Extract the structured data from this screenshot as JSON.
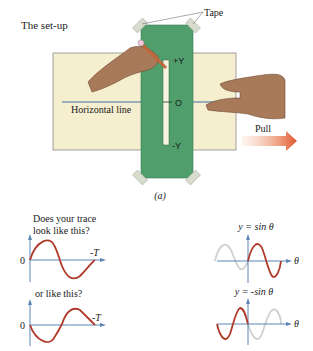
{
  "setup": {
    "title": "The set-up",
    "tape_label": "Tape",
    "strip_labels": {
      "top": "+Y",
      "middle": "O",
      "bottom": "-Y"
    },
    "horizontal_line_label": "Horizontal line",
    "pull_label": "Pull",
    "caption": "(a)"
  },
  "questions": {
    "q1": "Does your trace",
    "q1b": "look like this?",
    "q2": "or like this?"
  },
  "graphs": {
    "left1": {
      "zero": "0",
      "end": "-T"
    },
    "left2": {
      "zero": "0",
      "end": "-T"
    },
    "right1": {
      "title": "y = sin θ",
      "axis": "θ"
    },
    "right2": {
      "title": "y = -sin θ",
      "axis": "θ"
    }
  },
  "colors": {
    "paper": "#f6efcf",
    "strip": "#4f9e6c",
    "curve": "#b03a2a",
    "ghost": "#d0d0d0",
    "axis": "#5b86b8",
    "arrow": "#e05a2a"
  }
}
